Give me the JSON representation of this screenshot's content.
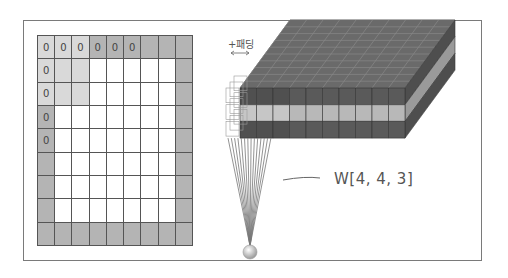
{
  "figure": {
    "padded_grid": {
      "rows": 9,
      "cols": 9,
      "zero_labels": [
        {
          "row": 0,
          "col": 0,
          "text": "0"
        },
        {
          "row": 0,
          "col": 1,
          "text": "0"
        },
        {
          "row": 0,
          "col": 2,
          "text": "0"
        },
        {
          "row": 0,
          "col": 3,
          "text": "0"
        },
        {
          "row": 0,
          "col": 4,
          "text": "0"
        },
        {
          "row": 0,
          "col": 5,
          "text": "0"
        },
        {
          "row": 1,
          "col": 0,
          "text": "0"
        },
        {
          "row": 2,
          "col": 0,
          "text": "0"
        },
        {
          "row": 3,
          "col": 0,
          "text": "0"
        },
        {
          "row": 4,
          "col": 0,
          "text": "0"
        }
      ],
      "highlight_region": {
        "rows": [
          0,
          1,
          2
        ],
        "cols": [
          0,
          1,
          2
        ]
      }
    },
    "padding_label": "+패딩",
    "weight_label": "W[4, 4, 3]",
    "cube": {
      "front_columns": 10,
      "layers": 3
    },
    "colors": {
      "padding": "#b4b4b4",
      "highlight": "#d9d9d9",
      "cube_dark": "#5a5a5a",
      "cube_light": "#b8b8b8",
      "line": "#777777",
      "frame": "#7a7a7a"
    }
  }
}
